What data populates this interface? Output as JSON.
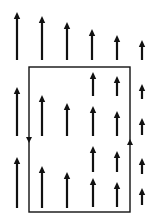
{
  "diagram": {
    "colors": {
      "ink": "#111111",
      "background": "#ffffff"
    },
    "field_arrows": [
      {
        "col": 1,
        "x": 17,
        "tip": 12,
        "base": 60
      },
      {
        "col": 2,
        "x": 42,
        "tip": 16,
        "base": 60
      },
      {
        "col": 3,
        "x": 67,
        "tip": 22,
        "base": 60
      },
      {
        "col": 4,
        "x": 92,
        "tip": 29,
        "base": 60
      },
      {
        "col": 5,
        "x": 117,
        "tip": 35,
        "base": 60
      },
      {
        "col": 6,
        "x": 142,
        "tip": 40,
        "base": 60
      },
      {
        "col": 1,
        "x": 17,
        "tip": 87,
        "base": 136
      },
      {
        "col": 2,
        "x": 42,
        "tip": 95,
        "base": 136
      },
      {
        "col": 3,
        "x": 67,
        "tip": 103,
        "base": 136
      },
      {
        "col": 1,
        "x": 17,
        "tip": 157,
        "base": 208
      },
      {
        "col": 2,
        "x": 42,
        "tip": 166,
        "base": 208
      },
      {
        "col": 3,
        "x": 67,
        "tip": 172,
        "base": 208
      },
      {
        "col": 4,
        "x": 93,
        "tip": 72,
        "base": 96
      },
      {
        "col": 4,
        "x": 93,
        "tip": 106,
        "base": 136
      },
      {
        "col": 4,
        "x": 93,
        "tip": 146,
        "base": 172
      },
      {
        "col": 4,
        "x": 93,
        "tip": 178,
        "base": 207
      },
      {
        "col": 5,
        "x": 117,
        "tip": 76,
        "base": 96
      },
      {
        "col": 5,
        "x": 117,
        "tip": 111,
        "base": 136
      },
      {
        "col": 5,
        "x": 117,
        "tip": 151,
        "base": 172
      },
      {
        "col": 5,
        "x": 117,
        "tip": 182,
        "base": 207
      },
      {
        "col": 6,
        "x": 142,
        "tip": 84,
        "base": 99
      },
      {
        "col": 6,
        "x": 142,
        "tip": 118,
        "base": 135
      },
      {
        "col": 6,
        "x": 142,
        "tip": 158,
        "base": 174
      },
      {
        "col": 6,
        "x": 142,
        "tip": 188,
        "base": 205
      }
    ],
    "loop": {
      "left": 29,
      "top": 67,
      "right": 130,
      "bottom": 212,
      "direction_markers": [
        {
          "edge": "left",
          "x": 29,
          "y": 143,
          "points": "down"
        },
        {
          "edge": "right",
          "x": 130,
          "y": 139,
          "points": "up"
        }
      ]
    }
  }
}
